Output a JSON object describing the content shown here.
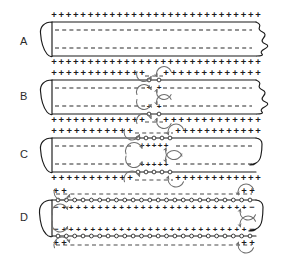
{
  "figure": {
    "background_color": "#ffffff",
    "ink_color": "#1b1b1b",
    "arrow_color": "#6f6f6f",
    "width": 284,
    "height": 257,
    "symbols": {
      "positive": "+",
      "negative": "−",
      "channel": "o"
    }
  },
  "panels": [
    {
      "id": "A",
      "label": "A",
      "label_x": 20,
      "label_y": 42,
      "caption": "Resting membrane potential: outside positive, inside negative along entire axon",
      "axon": {
        "left": 46,
        "right": 262,
        "top": 22,
        "bottom": 56
      },
      "outer_top_charges": "+ + + + + + + + + + + + + + + + + + + + + + + + + + + +",
      "outer_bottom_charges": "+ + + + + + + + + + + + + + + + + + + + + + + + + + + +",
      "inner_top_charges": "− − − − − − − − − − − − − − − − − − − −",
      "inner_bottom_charges": "− − − − − − − − − − − − − − − − − − − −",
      "depolarized_zone": null,
      "arrow_count": 0
    },
    {
      "id": "B",
      "label": "B",
      "label_x": 20,
      "label_y": 97,
      "caption": "Local depolarization begins at a point; local current loops form on both sides",
      "axon": {
        "left": 46,
        "right": 262,
        "top": 80,
        "bottom": 114
      },
      "outer_top_charges": "+ + + + + + + + + + +   o o   + + + + + + + + + + +",
      "outer_bottom_charges": "+ + + + + + + + + + +   o o   + + + + + + + + + + +",
      "inner_top_charges": "− − − − − − − − −   + +   − − − − − − − −",
      "inner_bottom_charges": "− − − − − − − − −   + +   − − − − − − − −",
      "depolarized_zone": {
        "center": 154,
        "half_width": 9
      },
      "arrow_count": 8
    },
    {
      "id": "C",
      "label": "C",
      "label_x": 20,
      "label_y": 155,
      "caption": "Depolarized region widens as current spreads to adjacent membrane",
      "axon": {
        "left": 46,
        "right": 262,
        "top": 138,
        "bottom": 172
      },
      "outer_top_charges": "+ + + + + + + + +   − − − −   + + + + + + + + +",
      "outer_bottom_charges": "+ + + + + + + + +   − − − −   + + + + + + + + +",
      "inner_top_charges": "− − − − − − −   + + + +   − − − − − − −",
      "inner_bottom_charges": "− − − − − − −   + + + +   − − − − − − −",
      "depolarized_zone": {
        "center": 154,
        "half_width": 22
      },
      "arrow_count": 8
    },
    {
      "id": "D",
      "label": "D",
      "label_x": 20,
      "label_y": 218,
      "caption": "Action potential has spread along nearly the whole axon; only the ends remain at rest",
      "axon": {
        "left": 46,
        "right": 262,
        "top": 200,
        "bottom": 236
      },
      "outer_top_charges": "+ +   − − − − − − − − − − − − − − − −   + +",
      "outer_bottom_charges": "+ +   − − − − − − − − − − − − − − − −   + +",
      "inner_top_charges": "−   + + + + + + + + + + + + + + + + + +   −",
      "inner_bottom_charges": "−   + + + + + + + + + + + + + + + + + +   −",
      "depolarized_zone": {
        "center": 154,
        "half_width": 96
      },
      "arrow_count": 8
    }
  ]
}
